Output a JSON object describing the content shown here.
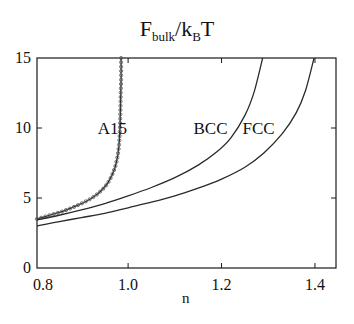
{
  "title": {
    "main": "F",
    "sub": "bulk",
    "sep": "/k",
    "sub2": "B",
    "tail": "T"
  },
  "chart_data": {
    "type": "line",
    "xlabel": "n",
    "ylabel": "",
    "xlim": [
      0.805,
      1.445
    ],
    "ylim": [
      0,
      15
    ],
    "xticks": [
      0.8,
      1.0,
      1.2,
      1.4
    ],
    "xtick_labels": [
      "0.8",
      "1.0",
      "1.2",
      "1.4"
    ],
    "yticks": [
      0,
      5,
      10,
      15
    ],
    "ytick_labels": [
      "0",
      "5",
      "10",
      "15"
    ],
    "grid": false,
    "legend": "none (inline curve labels)",
    "series": [
      {
        "name": "A15",
        "markers": true,
        "x": [
          0.805,
          0.83,
          0.86,
          0.89,
          0.92,
          0.94,
          0.955,
          0.965,
          0.972,
          0.977,
          0.98,
          0.982,
          0.983,
          0.984,
          0.985,
          0.985
        ],
        "y": [
          3.5,
          3.75,
          4.05,
          4.45,
          4.95,
          5.45,
          6.0,
          6.6,
          7.2,
          7.9,
          8.6,
          9.5,
          10.5,
          12.0,
          13.5,
          15.0
        ]
      },
      {
        "name": "BCC",
        "markers": false,
        "x": [
          0.805,
          0.85,
          0.9,
          0.95,
          1.0,
          1.05,
          1.1,
          1.15,
          1.19,
          1.22,
          1.25,
          1.27,
          1.288
        ],
        "y": [
          3.43,
          3.75,
          4.15,
          4.6,
          5.15,
          5.75,
          6.45,
          7.35,
          8.3,
          9.3,
          10.9,
          12.6,
          15.0
        ]
      },
      {
        "name": "FCC",
        "markers": false,
        "x": [
          0.805,
          0.85,
          0.9,
          0.95,
          1.0,
          1.05,
          1.1,
          1.15,
          1.2,
          1.25,
          1.29,
          1.33,
          1.36,
          1.38,
          1.398
        ],
        "y": [
          3.0,
          3.3,
          3.6,
          3.9,
          4.3,
          4.7,
          5.15,
          5.7,
          6.35,
          7.2,
          8.2,
          9.6,
          11.1,
          12.7,
          15.0
        ]
      }
    ],
    "annotations": [
      {
        "text": "A15",
        "x": 0.935,
        "y": 10.0
      },
      {
        "text": "BCC",
        "x": 1.14,
        "y": 10.0
      },
      {
        "text": "FCC",
        "x": 1.245,
        "y": 10.0
      }
    ]
  },
  "plot_box": {
    "left": 37,
    "top": 58,
    "right": 336,
    "bottom": 268
  },
  "colors": {
    "line": "#2a2a2a",
    "axis": "#1a1a1a",
    "marker": "#555555"
  }
}
